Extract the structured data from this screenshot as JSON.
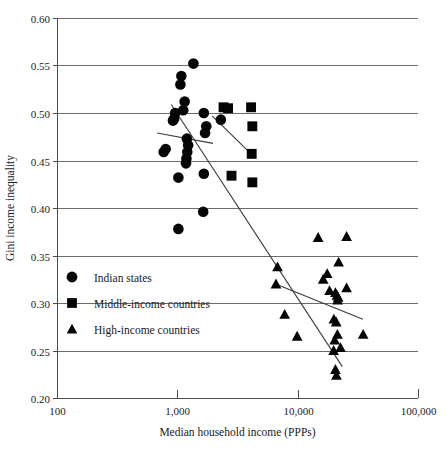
{
  "chart_data": {
    "type": "scatter",
    "title": "",
    "xlabel": "Median household income (PPPs)",
    "ylabel": "Gini income inequality",
    "xscale": "log",
    "yscale": "linear",
    "xlim": [
      100,
      100000
    ],
    "ylim": [
      0.2,
      0.6
    ],
    "grid": true,
    "legend_position": "inside-left-lower",
    "x_ticks": [
      "100",
      "1,000",
      "10,000",
      "100,000"
    ],
    "x_tick_values": [
      100,
      1000,
      10000,
      100000
    ],
    "y_ticks": [
      "0.60",
      "0.55",
      "0.50",
      "0.45",
      "0.40",
      "0.35",
      "0.30",
      "0.25",
      "0.20"
    ],
    "y_tick_values": [
      0.6,
      0.55,
      0.5,
      0.45,
      0.4,
      0.35,
      0.3,
      0.25,
      0.2
    ],
    "series": [
      {
        "name": "Indian states",
        "marker": "circle",
        "color": "#050505",
        "points": [
          [
            1360,
            0.552
          ],
          [
            1080,
            0.539
          ],
          [
            1060,
            0.53
          ],
          [
            1150,
            0.512
          ],
          [
            1120,
            0.503
          ],
          [
            960,
            0.5
          ],
          [
            1660,
            0.5
          ],
          [
            940,
            0.494
          ],
          [
            2300,
            0.493
          ],
          [
            920,
            0.492
          ],
          [
            1740,
            0.486
          ],
          [
            1700,
            0.479
          ],
          [
            1200,
            0.473
          ],
          [
            1230,
            0.466
          ],
          [
            800,
            0.462
          ],
          [
            770,
            0.459
          ],
          [
            1210,
            0.459
          ],
          [
            1190,
            0.452
          ],
          [
            1180,
            0.447
          ],
          [
            1020,
            0.432
          ],
          [
            1660,
            0.436
          ],
          [
            1640,
            0.396
          ],
          [
            1020,
            0.378
          ]
        ]
      },
      {
        "name": "Middle-income countries",
        "marker": "square",
        "color": "#050505",
        "points": [
          [
            2420,
            0.506
          ],
          [
            2640,
            0.505
          ],
          [
            4100,
            0.506
          ],
          [
            4200,
            0.486
          ],
          [
            4150,
            0.457
          ],
          [
            2820,
            0.434
          ],
          [
            4200,
            0.427
          ]
        ]
      },
      {
        "name": "High-income countries",
        "marker": "triangle",
        "color": "#050505",
        "points": [
          [
            14800,
            0.369
          ],
          [
            25500,
            0.37
          ],
          [
            21900,
            0.343
          ],
          [
            6800,
            0.338
          ],
          [
            17600,
            0.331
          ],
          [
            16300,
            0.325
          ],
          [
            6600,
            0.32
          ],
          [
            25500,
            0.316
          ],
          [
            18400,
            0.313
          ],
          [
            20600,
            0.311
          ],
          [
            21200,
            0.308
          ],
          [
            21700,
            0.306
          ],
          [
            21500,
            0.303
          ],
          [
            7800,
            0.288
          ],
          [
            20000,
            0.283
          ],
          [
            20900,
            0.28
          ],
          [
            9900,
            0.265
          ],
          [
            35000,
            0.267
          ],
          [
            21400,
            0.267
          ],
          [
            20300,
            0.261
          ],
          [
            22700,
            0.253
          ],
          [
            19900,
            0.25
          ],
          [
            20600,
            0.23
          ],
          [
            21000,
            0.224
          ]
        ]
      }
    ],
    "trendlines": [
      {
        "name": "overall-regression",
        "x0": 890,
        "y0": 0.509,
        "x1": 23500,
        "y1": 0.233
      },
      {
        "name": "indian-states-regression",
        "x0": 680,
        "y0": 0.479,
        "x1": 1980,
        "y1": 0.468
      },
      {
        "name": "middle-income-regression",
        "x0": 1950,
        "y0": 0.497,
        "x1": 4180,
        "y1": 0.456
      },
      {
        "name": "high-income-regression",
        "x0": 6560,
        "y0": 0.32,
        "x1": 34800,
        "y1": 0.283
      }
    ],
    "annotations": []
  },
  "legend": {
    "items": [
      {
        "label": "Indian states",
        "marker": "circle"
      },
      {
        "label": "Middle-income countries",
        "marker": "square"
      },
      {
        "label": "High-income countries",
        "marker": "triangle"
      }
    ]
  },
  "colors": {
    "marker": "#050505",
    "gridline": "#6b6b6b",
    "axis": "#4a4a4a",
    "text": "#1a1a1a",
    "background": "#ffffff"
  }
}
